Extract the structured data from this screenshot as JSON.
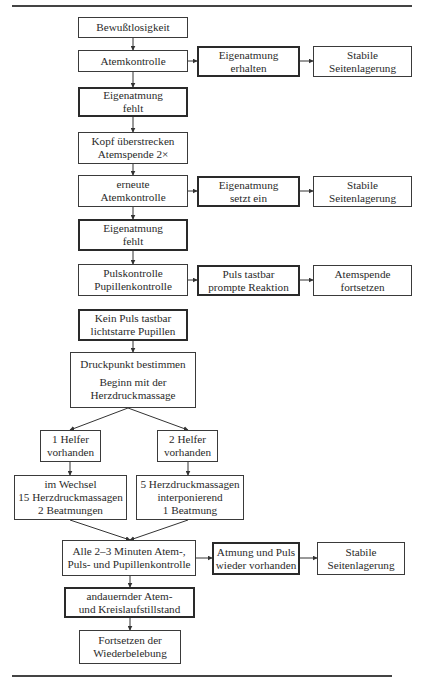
{
  "diagram": {
    "nodes": {
      "n1": {
        "lines": [
          "Bewußtlosigkeit"
        ]
      },
      "n2": {
        "lines": [
          "Atemkontrolle"
        ]
      },
      "n2a": {
        "lines": [
          "Eigenatmung",
          "erhalten"
        ]
      },
      "n2b": {
        "lines": [
          "Stabile",
          "Seitenlagerung"
        ]
      },
      "n3": {
        "lines": [
          "Eigenatmung",
          "fehlt"
        ]
      },
      "n4": {
        "lines": [
          "Kopf überstrecken",
          "Atemspende 2×"
        ]
      },
      "n5": {
        "lines": [
          "erneute",
          "Atemkontrolle"
        ]
      },
      "n5a": {
        "lines": [
          "Eigenatmung",
          "setzt ein"
        ]
      },
      "n5b": {
        "lines": [
          "Stabile",
          "Seitenlagerung"
        ]
      },
      "n6": {
        "lines": [
          "Eigenatmung",
          "fehlt"
        ]
      },
      "n7": {
        "lines": [
          "Pulskontrolle",
          "Pupillenkontrolle"
        ]
      },
      "n7a": {
        "lines": [
          "Puls tastbar",
          "prompte Reaktion"
        ]
      },
      "n7b": {
        "lines": [
          "Atemspende",
          "fortsetzen"
        ]
      },
      "n8": {
        "lines": [
          "Kein Puls tastbar",
          "lichtstarre Pupillen"
        ]
      },
      "n9": {
        "lines": [
          "Druckpunkt bestimmen",
          "Beginn mit der",
          "Herzdruckmassage"
        ]
      },
      "n10l": {
        "lines": [
          "1 Helfer",
          "vorhanden"
        ]
      },
      "n10r": {
        "lines": [
          "2 Helfer",
          "vorhanden"
        ]
      },
      "n11l": {
        "lines": [
          "im Wechsel",
          "15 Herzdruckmassagen",
          "2 Beatmungen"
        ]
      },
      "n11r": {
        "lines": [
          "5 Herzdruckmassagen",
          "interponierend",
          "1 Beatmung"
        ]
      },
      "n12": {
        "lines": [
          "Alle 2–3 Minuten Atem-,",
          "Puls- und Pupillenkontrolle"
        ]
      },
      "n12a": {
        "lines": [
          "Atmung und Puls",
          "wieder vorhanden"
        ]
      },
      "n12b": {
        "lines": [
          "Stabile",
          "Seitenlagerung"
        ]
      },
      "n13": {
        "lines": [
          "andauernder Atem-",
          "und Kreislaufstillstand"
        ]
      },
      "n14": {
        "lines": [
          "Fortsetzen der",
          "Wiederbelebung"
        ]
      }
    }
  }
}
